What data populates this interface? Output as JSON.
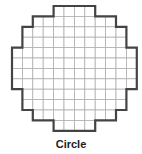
{
  "caption": "Circle",
  "grid": {
    "cols": 12,
    "rows": 12,
    "cell": 10.4,
    "origin": [
      12,
      6
    ],
    "row_spans": [
      [
        4,
        8
      ],
      [
        2,
        10
      ],
      [
        1,
        11
      ],
      [
        1,
        11
      ],
      [
        0,
        12
      ],
      [
        0,
        12
      ],
      [
        0,
        12
      ],
      [
        0,
        12
      ],
      [
        1,
        11
      ],
      [
        1,
        11
      ],
      [
        2,
        10
      ],
      [
        4,
        8
      ]
    ],
    "grid_color": "#b0b0b0",
    "outline_color": "#444444"
  }
}
